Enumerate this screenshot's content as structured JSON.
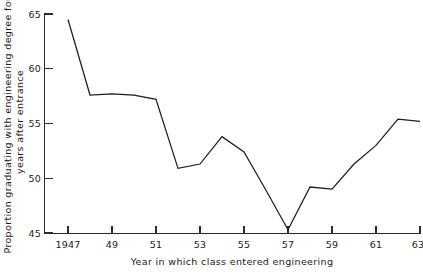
{
  "chart_data": {
    "type": "line",
    "title": "",
    "subtitle": "",
    "xlabel": "Year in which class entered engineering",
    "ylabel": "Proportion graduating with engineering degree four years after entrance",
    "ylabel_line1": "Proportion graduating with engineering degree four",
    "ylabel_line2": "years after entrance",
    "grid": false,
    "legend": false,
    "legend_position": "none",
    "xlim": [
      1947,
      1963
    ],
    "ylim": [
      45,
      65
    ],
    "x": [
      1947,
      1948,
      1949,
      1950,
      1951,
      1952,
      1953,
      1954,
      1955,
      1956,
      1957,
      1958,
      1959,
      1960,
      1961,
      1962,
      1963
    ],
    "values": [
      64.5,
      57.6,
      57.7,
      57.6,
      57.2,
      50.9,
      51.3,
      53.8,
      52.4,
      48.9,
      45.3,
      49.2,
      49.0,
      51.3,
      53.0,
      55.4,
      55.2
    ],
    "series": [
      {
        "name": "Proportion graduating",
        "values": [
          64.5,
          57.6,
          57.7,
          57.6,
          57.2,
          50.9,
          51.3,
          53.8,
          52.4,
          48.9,
          45.3,
          49.2,
          49.0,
          51.3,
          53.0,
          55.4,
          55.2
        ]
      }
    ],
    "yticks": [
      45,
      50,
      55,
      60,
      65
    ],
    "ytick_labels": [
      "45",
      "50",
      "55",
      "60",
      "65"
    ],
    "xticks": [
      1947,
      1949,
      1951,
      1953,
      1955,
      1957,
      1959,
      1961,
      1963
    ],
    "xtick_labels": [
      "1947",
      "49",
      "51",
      "53",
      "55",
      "57",
      "59",
      "61",
      "63"
    ],
    "line_color": "#1d1d1d",
    "axis_color": "#2b2b2b",
    "background_color": "#ffffff"
  }
}
